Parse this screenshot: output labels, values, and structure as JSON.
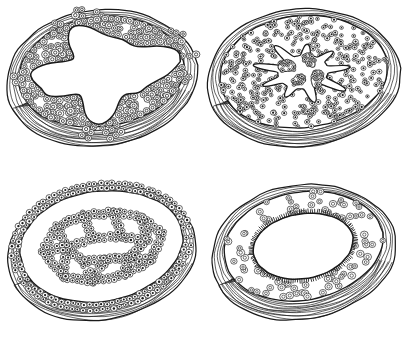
{
  "figure": {
    "background_color": "#ffffff",
    "ink_color": "#1a1a1a",
    "panel_count": 4,
    "grid": {
      "rows": 2,
      "columns": 2
    },
    "has_text_labels": false
  },
  "panels": [
    {
      "id": "panel-1",
      "position": "top-left",
      "name": "wide-irregular-lumen-section",
      "lumen_shape": "wide irregular star-notched cavity",
      "epithelium": "single thick layer of large round cells with ring nuclei",
      "cell_size": "large",
      "cell_density": "low",
      "wall_layers": 4,
      "outer_wall": "wavy concentric fibrous contour lines",
      "lumen_fill": "#ffffff"
    },
    {
      "id": "panel-2",
      "position": "top-right",
      "name": "branched-stellate-lumen-section",
      "lumen_shape": "branched stellate cavity with finger-like clefts",
      "epithelium": "dense stippled glandular tissue with small dark nuclei",
      "cell_size": "small",
      "cell_density": "high",
      "wall_layers": 4,
      "outer_wall": "wavy concentric fibrous contour lines",
      "lumen_fill": "#ffffff"
    },
    {
      "id": "panel-3",
      "position": "bottom-left",
      "name": "reticular-network-section",
      "lumen_shape": "polygonal reticular meshwork of open spaces",
      "epithelium": "two-cell-thick anastomosing cords of cuboidal cells",
      "cell_size": "medium",
      "cell_density": "medium",
      "wall_layers": 4,
      "outer_wall": "wavy concentric fibrous contour lines",
      "lumen_fill": "#ffffff"
    },
    {
      "id": "panel-4",
      "position": "bottom-right",
      "name": "ciliated-oval-lumen-section",
      "lumen_shape": "smooth oval cavity",
      "epithelium": "sparse scattered round cells with ciliated brush border",
      "cell_size": "medium",
      "cell_density": "sparse",
      "border_feature": "cilia",
      "wall_layers": 4,
      "outer_wall": "wavy concentric fibrous contour lines",
      "lumen_fill": "#ffffff"
    }
  ]
}
